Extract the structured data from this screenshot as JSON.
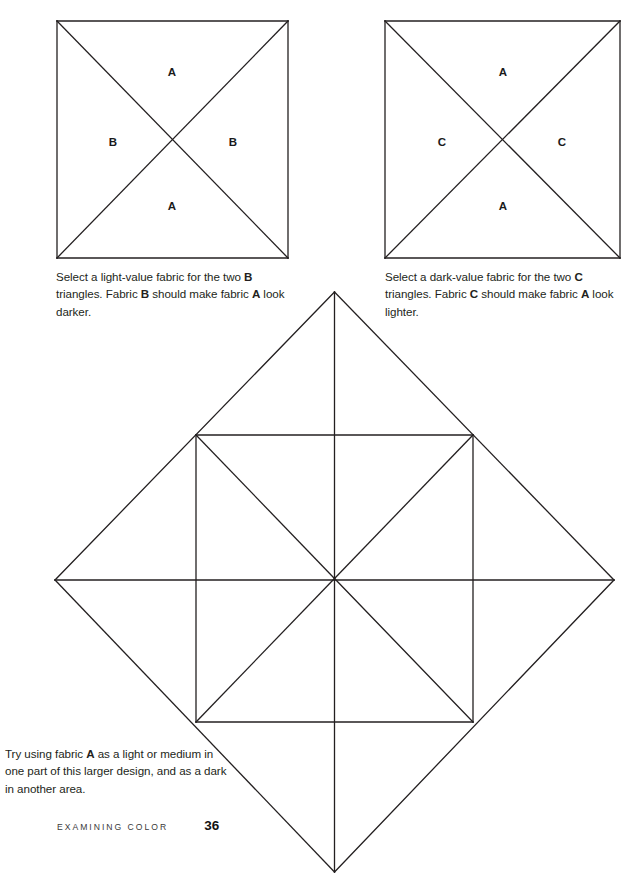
{
  "page": {
    "width": 644,
    "height": 882,
    "background": "#ffffff",
    "line_color": "#231f20"
  },
  "footer": {
    "book_section": "EXAMINING COLOR",
    "page_number": "36"
  },
  "blocks": [
    {
      "id": "block-ab",
      "name": "quarter-square-triangle-block-ab",
      "x": 57,
      "y": 21,
      "w": 231,
      "h": 237,
      "labels": [
        {
          "text": "A",
          "cx": 172,
          "cy": 72
        },
        {
          "text": "B",
          "cx": 113,
          "cy": 142
        },
        {
          "text": "B",
          "cx": 233,
          "cy": 142
        },
        {
          "text": "A",
          "cx": 172,
          "cy": 206
        }
      ]
    },
    {
      "id": "block-ac",
      "name": "quarter-square-triangle-block-ac",
      "x": 385,
      "y": 21,
      "w": 235,
      "h": 237,
      "labels": [
        {
          "text": "A",
          "cx": 503,
          "cy": 72
        },
        {
          "text": "C",
          "cx": 442,
          "cy": 142
        },
        {
          "text": "C",
          "cx": 562,
          "cy": 142
        },
        {
          "text": "A",
          "cx": 503,
          "cy": 206
        }
      ]
    }
  ],
  "diamond": {
    "name": "large-on-point-quilt-design",
    "top": {
      "x": 334.5,
      "y": 292
    },
    "right": {
      "x": 614,
      "y": 580
    },
    "bottom": {
      "x": 334.5,
      "y": 872
    },
    "left": {
      "x": 55,
      "y": 580
    },
    "inner_square": {
      "x": 196,
      "y": 435,
      "w": 277,
      "h": 287
    }
  },
  "captions": {
    "left": {
      "parts": [
        {
          "t": "Select a light-value fabric for the two ",
          "b": false
        },
        {
          "t": "B",
          "b": true
        },
        {
          "t": " triangles. Fabric ",
          "b": false
        },
        {
          "t": "B",
          "b": true
        },
        {
          "t": " should make fabric ",
          "b": false
        },
        {
          "t": "A",
          "b": true
        },
        {
          "t": " look darker.",
          "b": false
        }
      ]
    },
    "right": {
      "parts": [
        {
          "t": "Select a dark-value fabric for the two ",
          "b": false
        },
        {
          "t": "C",
          "b": true
        },
        {
          "t": " triangles. Fabric ",
          "b": false
        },
        {
          "t": "C",
          "b": true
        },
        {
          "t": " should make fabric ",
          "b": false
        },
        {
          "t": "A",
          "b": true
        },
        {
          "t": " look lighter.",
          "b": false
        }
      ]
    },
    "bottom": {
      "parts": [
        {
          "t": "Try using fabric ",
          "b": false
        },
        {
          "t": "A",
          "b": true
        },
        {
          "t": " as a light or medium in one part of this larger design, and as a dark in another area.",
          "b": false
        }
      ]
    }
  }
}
